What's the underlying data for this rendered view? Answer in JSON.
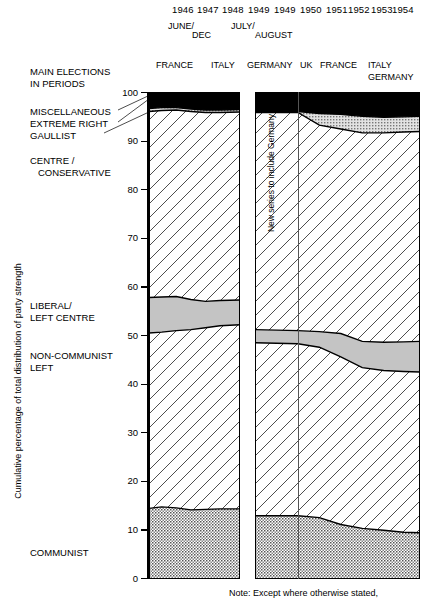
{
  "header": {
    "years": [
      {
        "label": "1946",
        "x": 172
      },
      {
        "label": "1947",
        "x": 197
      },
      {
        "label": "1948",
        "x": 222
      },
      {
        "label": "1949",
        "x": 248
      },
      {
        "label": "1949",
        "x": 274
      },
      {
        "label": "1950",
        "x": 300
      },
      {
        "label": "1951",
        "x": 326
      },
      {
        "label": "1952",
        "x": 348
      },
      {
        "label": "1953",
        "x": 371
      },
      {
        "label": "1954",
        "x": 392
      }
    ],
    "periods": [
      {
        "top": "JUNE",
        "slash": "/",
        "bottom": "DEC",
        "x": 168
      },
      {
        "top": "JULY",
        "slash": "/",
        "bottom": "AUGUST",
        "x": 231
      }
    ],
    "countries": [
      {
        "label": "FRANCE",
        "x": 156,
        "row": 1
      },
      {
        "label": "ITALY",
        "x": 211,
        "row": 1
      },
      {
        "label": "GERMANY",
        "x": 247,
        "row": 1
      },
      {
        "label": "UK",
        "x": 300,
        "row": 1
      },
      {
        "label": "FRANCE",
        "x": 320,
        "row": 1
      },
      {
        "label": "ITALY",
        "x": 368,
        "row": 1
      },
      {
        "label": "GERMANY",
        "x": 368,
        "row": 2
      }
    ]
  },
  "main_title": "MAIN ELECTIONS\nIN PERIODS",
  "categories": [
    {
      "name": "miscellaneous",
      "label": "MISCELLANEOUS",
      "x": 30,
      "y": 106
    },
    {
      "name": "extreme-right",
      "label": "EXTREME RIGHT",
      "x": 30,
      "y": 118
    },
    {
      "name": "gaullist",
      "label": "GAULLIST",
      "x": 30,
      "y": 130
    },
    {
      "name": "centre-conservative",
      "label": "CENTRE /\n   CONSERVATIVE",
      "x": 30,
      "y": 155
    },
    {
      "name": "liberal-left-centre",
      "label": "LIBERAL/\nLEFT CENTRE",
      "x": 30,
      "y": 300
    },
    {
      "name": "non-communist-left",
      "label": "NON-COMMUNIST\nLEFT",
      "x": 30,
      "y": 350
    },
    {
      "name": "communist",
      "label": "COMMUNIST",
      "x": 30,
      "y": 547
    }
  ],
  "y_axis": {
    "title": "Cumulative percentage of total distribution of party strength",
    "ticks": [
      0,
      10,
      20,
      30,
      40,
      50,
      60,
      70,
      80,
      90,
      100
    ],
    "min": 0,
    "max": 100
  },
  "annotations": {
    "new_series": "New series to include Germany",
    "note": "Note: Except where otherwise stated,"
  },
  "colors": {
    "miscellaneous": "#000000",
    "extreme_right": "#9a9a9a",
    "gaullist": "#ffffff",
    "centre_conservative": "#ffffff",
    "liberal_left_centre": "#c4c4c4",
    "non_communist_left": "#ffffff",
    "communist": "#8c8c8c",
    "axis": "#000000",
    "divider": "#555555"
  },
  "chart_data": {
    "type": "area",
    "title": "Cumulative percentage of total distribution of party strength",
    "xlabel": "",
    "ylabel": "Cumulative percentage of total distribution of party strength",
    "ylim": [
      0,
      100
    ],
    "grid": false,
    "legend": "left-labels",
    "stacking": "cumulative-boundaries",
    "series_order": [
      "Communist",
      "Non-communist left",
      "Liberal / Left centre",
      "Centre / Conservative",
      "Gaullist",
      "Extreme right",
      "Miscellaneous"
    ],
    "panels": [
      {
        "name": "left",
        "countries": [
          "FRANCE",
          "ITALY"
        ],
        "x_fraction": [
          0,
          0.14,
          0.3,
          0.46,
          0.62,
          0.78,
          1.0
        ],
        "boundaries": {
          "communist_top": [
            14.5,
            14.8,
            14.6,
            14.2,
            14.3,
            14.4,
            14.4
          ],
          "non_communist_top": [
            50.5,
            50.7,
            51.0,
            51.2,
            51.6,
            52.0,
            52.2
          ],
          "liberal_top": [
            57.8,
            57.9,
            58.0,
            57.4,
            57.0,
            57.2,
            57.3
          ],
          "centre_top": [
            96.0,
            96.2,
            96.3,
            96.0,
            95.8,
            95.8,
            95.9
          ],
          "gaullist_top": [
            96.0,
            96.2,
            96.3,
            96.0,
            95.8,
            95.8,
            95.9
          ],
          "extreme_right_top": [
            96.6,
            96.8,
            96.8,
            96.5,
            96.3,
            96.3,
            96.4
          ],
          "miscellaneous_top": [
            100,
            100,
            100,
            100,
            100,
            100,
            100
          ]
        }
      },
      {
        "name": "right",
        "countries": [
          "GERMANY",
          "UK",
          "FRANCE",
          "ITALY",
          "GERMANY"
        ],
        "x_fraction": [
          0,
          0.13,
          0.26,
          0.39,
          0.52,
          0.65,
          0.78,
          0.9,
          1.0
        ],
        "boundaries": {
          "communist_top": [
            13.0,
            13.0,
            13.0,
            12.6,
            11.2,
            10.4,
            10.0,
            9.6,
            9.5
          ],
          "non_communist_top": [
            48.5,
            48.4,
            48.3,
            47.6,
            45.6,
            43.4,
            42.8,
            42.6,
            42.5
          ],
          "liberal_top": [
            51.2,
            51.1,
            51.0,
            50.8,
            50.4,
            48.8,
            48.6,
            48.7,
            48.8
          ],
          "centre_top": [
            95.8,
            95.8,
            95.8,
            93.2,
            92.4,
            91.6,
            91.6,
            91.8,
            91.9
          ],
          "gaullist_top": [
            95.8,
            95.8,
            95.8,
            93.2,
            92.4,
            91.6,
            91.6,
            91.8,
            91.9
          ],
          "extreme_right_top": [
            96.0,
            96.0,
            96.0,
            95.6,
            95.4,
            95.0,
            94.8,
            94.9,
            95.0
          ],
          "miscellaneous_top": [
            100,
            100,
            100,
            100,
            100,
            100,
            100,
            100,
            100
          ]
        }
      }
    ]
  }
}
